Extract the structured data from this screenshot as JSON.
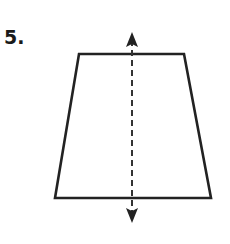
{
  "problem": {
    "number_label": "5."
  },
  "figure": {
    "shape": "isosceles trapezoid",
    "line_of_symmetry": "vertical dashed line with arrows at both ends",
    "stroke_color": "#222222"
  }
}
